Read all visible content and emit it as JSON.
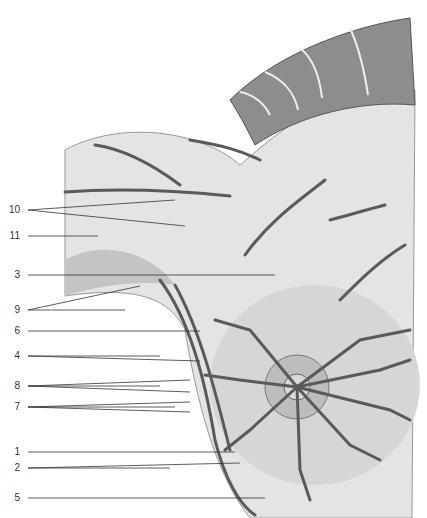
{
  "figure": {
    "colors": {
      "skin": "#e2e2e2",
      "skin_shade": "#c9c9c9",
      "muscle": "#8a8a8a",
      "vessel": "#5a5a5a",
      "line": "#333333"
    }
  },
  "labels": [
    {
      "id": "10",
      "x": 12,
      "y": 210,
      "targets": [
        [
          175,
          200
        ],
        [
          185,
          226
        ]
      ]
    },
    {
      "id": "11",
      "x": 12,
      "y": 236,
      "targets": [
        [
          98,
          236
        ]
      ]
    },
    {
      "id": "3",
      "x": 12,
      "y": 275,
      "targets": [
        [
          275,
          275
        ]
      ]
    },
    {
      "id": "9",
      "x": 12,
      "y": 310,
      "targets": [
        [
          125,
          310
        ],
        [
          140,
          286
        ]
      ]
    },
    {
      "id": "6",
      "x": 12,
      "y": 331,
      "targets": [
        [
          200,
          331
        ]
      ]
    },
    {
      "id": "4",
      "x": 12,
      "y": 356,
      "targets": [
        [
          160,
          356
        ],
        [
          200,
          361
        ]
      ]
    },
    {
      "id": "8",
      "x": 12,
      "y": 386,
      "targets": [
        [
          160,
          386
        ],
        [
          190,
          380
        ],
        [
          190,
          392
        ]
      ]
    },
    {
      "id": "7",
      "x": 12,
      "y": 407,
      "targets": [
        [
          175,
          407
        ],
        [
          190,
          402
        ],
        [
          190,
          412
        ]
      ]
    },
    {
      "id": "1",
      "x": 12,
      "y": 452,
      "targets": [
        [
          235,
          452
        ]
      ]
    },
    {
      "id": "2",
      "x": 12,
      "y": 468,
      "targets": [
        [
          170,
          468
        ],
        [
          240,
          463
        ]
      ]
    },
    {
      "id": "5",
      "x": 12,
      "y": 498,
      "targets": [
        [
          265,
          498
        ]
      ]
    }
  ]
}
